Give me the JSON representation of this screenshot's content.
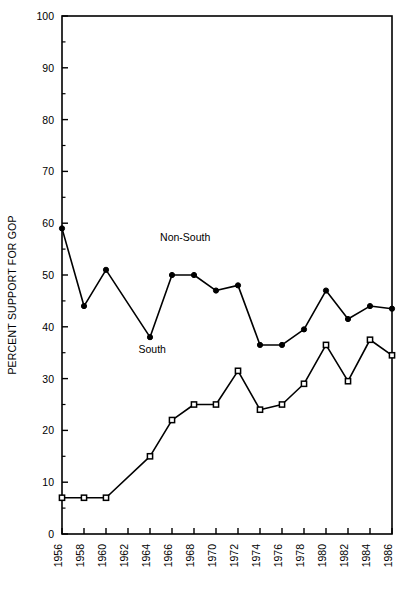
{
  "chart_data": {
    "type": "line",
    "title": "",
    "subtitle": "",
    "xlabel": "",
    "ylabel": "PERCENT SUPPORT FOR GOP",
    "xlim": [
      1956,
      1986
    ],
    "ylim": [
      0,
      100
    ],
    "grid": false,
    "legend_position": "inline-annotation",
    "x": [
      1956,
      1958,
      1960,
      1964,
      1966,
      1968,
      1970,
      1972,
      1974,
      1976,
      1978,
      1980,
      1982,
      1984,
      1986
    ],
    "x_tick_labels": [
      "1956",
      "1958",
      "1960",
      "1962",
      "1964",
      "1966",
      "1968",
      "1970",
      "1972",
      "1974",
      "1976",
      "1978",
      "1980",
      "1982",
      "1984",
      "1986"
    ],
    "x_tick_values": [
      1956,
      1958,
      1960,
      1962,
      1964,
      1966,
      1968,
      1970,
      1972,
      1974,
      1976,
      1978,
      1980,
      1982,
      1984,
      1986
    ],
    "y_tick_labels": [
      "0",
      "10",
      "20",
      "30",
      "40",
      "50",
      "60",
      "70",
      "80",
      "90",
      "100"
    ],
    "y_tick_values": [
      0,
      10,
      20,
      30,
      40,
      50,
      60,
      70,
      80,
      90,
      100
    ],
    "y_minor_tick_values": [
      5,
      15,
      25,
      35,
      45,
      55,
      65,
      75,
      85,
      95
    ],
    "series": [
      {
        "name": "Non-South",
        "marker": "filled-circle",
        "color": "#000000",
        "label_x": 1967.2,
        "label_y": 56.5,
        "values": [
          59.0,
          44.0,
          51.0,
          38.0,
          50.0,
          50.0,
          47.0,
          48.0,
          36.5,
          36.5,
          39.5,
          47.0,
          41.5,
          44.0,
          43.5
        ]
      },
      {
        "name": "South",
        "marker": "open-square",
        "color": "#000000",
        "label_x": 1964.2,
        "label_y": 35.0,
        "values": [
          7.0,
          7.0,
          7.0,
          15.0,
          22.0,
          25.0,
          25.0,
          31.5,
          24.0,
          25.0,
          29.0,
          36.5,
          29.5,
          37.5,
          34.5
        ]
      }
    ]
  }
}
